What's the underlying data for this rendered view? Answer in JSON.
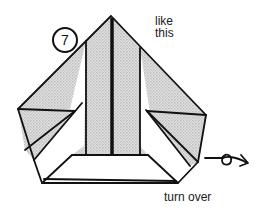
{
  "diagram": {
    "type": "origami-instruction-step",
    "step_number": "7",
    "caption_top": [
      "like",
      "this"
    ],
    "caption_bottom": "turn over",
    "symbols": {
      "turn_over_arrow": "turn-over-arrow-icon"
    },
    "colors": {
      "line": "#111111",
      "shaded_paper": "#d4d4d4",
      "white_paper": "#ffffff",
      "background": "#ffffff"
    }
  }
}
